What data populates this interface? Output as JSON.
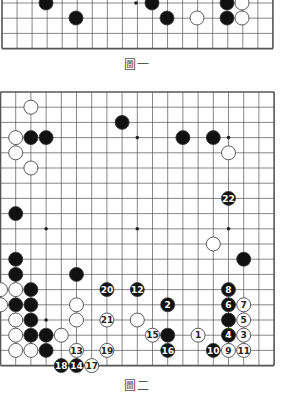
{
  "figure1": {
    "caption": "圖一",
    "visible_rows": 4,
    "note": "partial board, bottom rows visible",
    "black": [
      [
        9,
        0
      ],
      [
        15,
        0
      ],
      [
        24,
        0
      ],
      [
        6,
        1
      ],
      [
        17,
        1
      ],
      [
        24,
        1
      ]
    ],
    "white": [
      [
        26,
        0
      ],
      [
        20,
        1
      ],
      [
        26,
        1
      ]
    ],
    "star": [
      [
        12,
        0
      ]
    ]
  },
  "figure2": {
    "caption": "圖二",
    "size": 19,
    "black": [
      [
        2,
        3
      ],
      [
        3,
        3
      ],
      [
        8,
        2
      ],
      [
        12,
        3
      ],
      [
        14,
        3
      ],
      [
        1,
        8
      ],
      [
        1,
        11
      ],
      [
        1,
        12
      ],
      [
        5,
        12
      ],
      [
        2,
        13
      ],
      [
        1,
        14
      ],
      [
        2,
        14
      ],
      [
        2,
        15
      ],
      [
        2,
        16
      ],
      [
        3,
        16
      ],
      [
        3,
        17
      ],
      [
        16,
        11
      ]
    ],
    "white": [
      [
        2,
        1
      ],
      [
        1,
        3
      ],
      [
        1,
        4
      ],
      [
        2,
        5
      ],
      [
        15,
        4
      ],
      [
        14,
        10
      ],
      [
        0,
        13
      ],
      [
        1,
        13
      ],
      [
        0,
        14
      ],
      [
        5,
        14
      ],
      [
        1,
        15
      ],
      [
        5,
        15
      ],
      [
        9,
        15
      ],
      [
        1,
        16
      ],
      [
        2,
        16
      ],
      [
        4,
        16
      ],
      [
        1,
        17
      ],
      [
        2,
        17
      ]
    ],
    "black_numbered": [
      {
        "n": 2,
        "col": 11,
        "row": 14
      },
      {
        "n": 4,
        "col": 15,
        "row": 16
      },
      {
        "n": 6,
        "col": 15,
        "row": 14
      },
      {
        "n": 8,
        "col": 15,
        "row": 13
      },
      {
        "n": 10,
        "col": 14,
        "row": 17
      },
      {
        "n": 12,
        "col": 9,
        "row": 13
      },
      {
        "n": 14,
        "col": 5,
        "row": 18
      },
      {
        "n": 16,
        "col": 11,
        "row": 17
      },
      {
        "n": 18,
        "col": 4,
        "row": 18
      },
      {
        "n": 20,
        "col": 7,
        "row": 13
      },
      {
        "n": 22,
        "col": 15,
        "row": 7
      }
    ],
    "white_numbered": [
      {
        "n": 1,
        "col": 13,
        "row": 16
      },
      {
        "n": 3,
        "col": 16,
        "row": 16
      },
      {
        "n": 5,
        "col": 16,
        "row": 15
      },
      {
        "n": 7,
        "col": 16,
        "row": 14
      },
      {
        "n": 9,
        "col": 15,
        "row": 17
      },
      {
        "n": 11,
        "col": 16,
        "row": 17
      },
      {
        "n": 13,
        "col": 5,
        "row": 17
      },
      {
        "n": 15,
        "col": 10,
        "row": 16
      },
      {
        "n": 17,
        "col": 6,
        "row": 18
      },
      {
        "n": 19,
        "col": 7,
        "row": 17
      },
      {
        "n": 21,
        "col": 7,
        "row": 15
      }
    ],
    "extra_black": [
      [
        15,
        15
      ],
      [
        11,
        16
      ]
    ],
    "star": [
      [
        3,
        3
      ],
      [
        9,
        3
      ],
      [
        15,
        3
      ],
      [
        3,
        9
      ],
      [
        9,
        9
      ],
      [
        15,
        9
      ],
      [
        3,
        15
      ],
      [
        9,
        15
      ],
      [
        15,
        15
      ]
    ]
  }
}
